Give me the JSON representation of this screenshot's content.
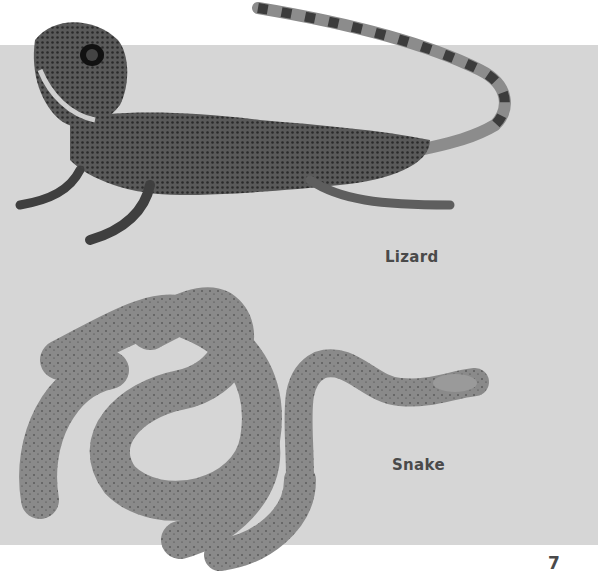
{
  "page": {
    "background_color": "#ffffff",
    "panel_color": "#d6d6d6",
    "text_color": "#4a4a4a",
    "page_number": "7"
  },
  "figures": [
    {
      "id": "lizard",
      "label": "Lizard",
      "image": "lizard-photo"
    },
    {
      "id": "snake",
      "label": "Snake",
      "image": "snake-photo"
    }
  ]
}
